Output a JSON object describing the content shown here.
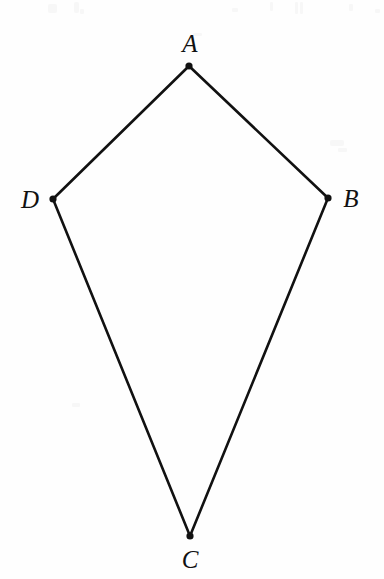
{
  "figure": {
    "type": "kite-quadrilateral",
    "name": "Kite ABCD",
    "background_color": "#fefefe",
    "stroke_color": "#111111",
    "stroke_width": 2.6,
    "vertex_dot_color": "#111111",
    "vertex_dot_radius": 3.6,
    "canvas": {
      "width": 384,
      "height": 579
    },
    "vertices": [
      {
        "id": "A",
        "label": "A",
        "x": 189,
        "y": 66,
        "label_x": 190,
        "label_y": 43,
        "label_position": "above"
      },
      {
        "id": "B",
        "label": "B",
        "x": 328,
        "y": 198,
        "label_x": 351,
        "label_y": 198,
        "label_position": "right"
      },
      {
        "id": "C",
        "label": "C",
        "x": 190,
        "y": 536,
        "label_x": 190,
        "label_y": 559,
        "label_position": "below"
      },
      {
        "id": "D",
        "label": "D",
        "x": 53,
        "y": 199,
        "label_x": 30,
        "label_y": 199,
        "label_position": "left"
      }
    ],
    "edges": [
      {
        "id": "AB",
        "from": "A",
        "to": "B"
      },
      {
        "id": "BC",
        "from": "B",
        "to": "C"
      },
      {
        "id": "CD",
        "from": "C",
        "to": "D"
      },
      {
        "id": "DA",
        "from": "D",
        "to": "A"
      }
    ]
  }
}
